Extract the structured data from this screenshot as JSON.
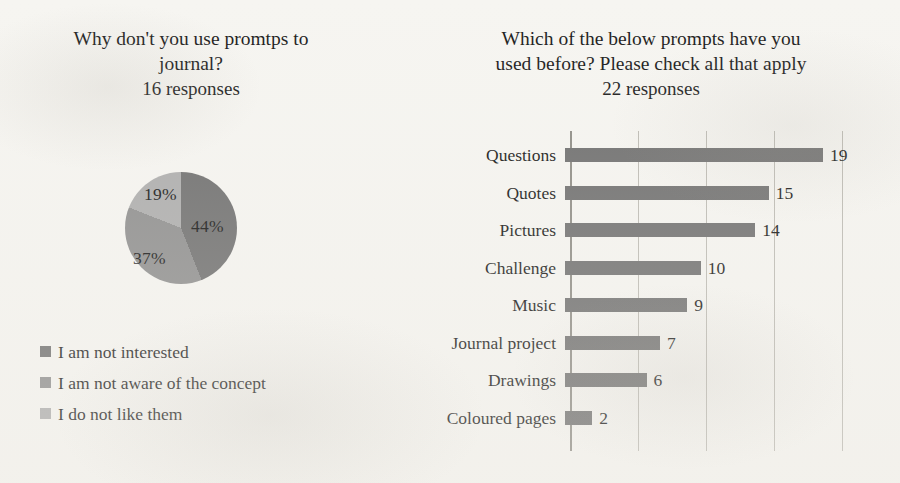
{
  "pie_panel": {
    "title_line1": "Why don't you use promtps to",
    "title_line2": "journal?",
    "responses": "16 responses",
    "legend": [
      {
        "label": "I am not interested",
        "color": "#6f6f6f",
        "swatch_name": "legend-swatch-not-interested"
      },
      {
        "label": "I am not aware of the concept",
        "color": "#8e8e8e",
        "swatch_name": "legend-swatch-not-aware"
      },
      {
        "label": "I do not like them",
        "color": "#adadad",
        "swatch_name": "legend-swatch-do-not-like"
      }
    ]
  },
  "bar_panel": {
    "title_line1": "Which of the below prompts have you",
    "title_line2": "used before? Please check all that apply",
    "responses": "22 responses"
  },
  "chart_data": [
    {
      "type": "pie",
      "title": "Why don't you use promtps to journal?",
      "subtitle": "16 responses",
      "labels": [
        "I am not interested",
        "I am not aware of the concept",
        "I do not like them"
      ],
      "values": [
        44,
        37,
        19
      ],
      "value_labels": [
        "44%",
        "37%",
        "19%"
      ],
      "unit": "percent",
      "colors": [
        "#6f6f6f",
        "#8e8e8e",
        "#adadad"
      ],
      "legend_position": "bottom-left",
      "start_angle_deg": 0,
      "direction": "clockwise"
    },
    {
      "type": "bar",
      "orientation": "horizontal",
      "title": "Which of the below prompts have you used before? Please check all that apply",
      "subtitle": "22 responses",
      "categories": [
        "Questions",
        "Quotes",
        "Pictures",
        "Challenge",
        "Music",
        "Journal project",
        "Drawings",
        "Coloured  pages"
      ],
      "values": [
        19,
        15,
        14,
        10,
        9,
        7,
        6,
        2
      ],
      "xlabel": "",
      "ylabel": "",
      "xlim": [
        0,
        24
      ],
      "gridlines": [
        5,
        10,
        15,
        20
      ],
      "grid": true,
      "data_labels": true,
      "bar_color": "#6f6f6f",
      "legend_position": "none"
    }
  ]
}
